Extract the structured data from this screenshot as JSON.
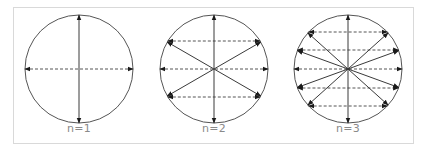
{
  "figure": {
    "border_color": "#d9d9d9",
    "line_color": "#3a3a3a",
    "dashed_color": "#555555",
    "label_color": "#8a8a8a",
    "panels": [
      {
        "label": "n=1",
        "cx": 79,
        "cy": 69,
        "r": 54,
        "solid_angles_deg": [
          90
        ],
        "dashed_y_offsets": [
          0
        ]
      },
      {
        "label": "n=2",
        "cx": 214,
        "cy": 69,
        "r": 54,
        "solid_angles_deg": [
          90,
          30,
          -30
        ],
        "dashed_y_offsets": [
          -28,
          0,
          28
        ]
      },
      {
        "label": "n=3",
        "cx": 348,
        "cy": 69,
        "r": 54,
        "solid_angles_deg": [
          90,
          42,
          20,
          -20,
          -42
        ],
        "dashed_y_offsets": [
          -37,
          -19,
          0,
          19,
          37
        ]
      }
    ]
  }
}
